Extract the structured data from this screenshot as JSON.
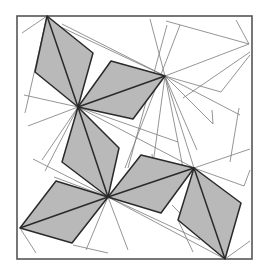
{
  "figure": {
    "kind": "geometric-diagram",
    "colors": {
      "background": "#ffffff",
      "frame": "#555555",
      "kite_fill": "#b9b9b9",
      "kite_stroke": "#2a2a2a",
      "construction_line": "#7a7a7a"
    },
    "frame": {
      "x": 17,
      "y": 16,
      "width": 235,
      "height": 243
    },
    "hub_vertices": [
      {
        "name": "A",
        "x": 47,
        "y": 16
      },
      {
        "name": "B",
        "x": 78,
        "y": 107
      },
      {
        "name": "C",
        "x": 165,
        "y": 76
      },
      {
        "name": "D",
        "x": 108,
        "y": 197
      },
      {
        "name": "E",
        "x": 20,
        "y": 228
      },
      {
        "name": "F",
        "x": 194,
        "y": 168
      },
      {
        "name": "G",
        "x": 225,
        "y": 259
      }
    ],
    "kites": [
      {
        "id": 1,
        "points": [
          [
            47,
            16
          ],
          [
            93,
            53
          ],
          [
            78,
            107
          ],
          [
            35,
            72
          ]
        ],
        "diagonal": [
          [
            47,
            16
          ],
          [
            78,
            107
          ]
        ]
      },
      {
        "id": 2,
        "points": [
          [
            78,
            107
          ],
          [
            111,
            61
          ],
          [
            165,
            76
          ],
          [
            133,
            119
          ]
        ],
        "diagonal": [
          [
            78,
            107
          ],
          [
            165,
            76
          ]
        ]
      },
      {
        "id": 3,
        "points": [
          [
            78,
            107
          ],
          [
            119,
            148
          ],
          [
            108,
            197
          ],
          [
            62,
            162
          ]
        ],
        "diagonal": [
          [
            78,
            107
          ],
          [
            108,
            197
          ]
        ]
      },
      {
        "id": 4,
        "points": [
          [
            20,
            228
          ],
          [
            56,
            181
          ],
          [
            108,
            197
          ],
          [
            72,
            243
          ]
        ],
        "diagonal": [
          [
            20,
            228
          ],
          [
            108,
            197
          ]
        ]
      },
      {
        "id": 5,
        "points": [
          [
            108,
            197
          ],
          [
            141,
            155
          ],
          [
            194,
            168
          ],
          [
            161,
            213
          ]
        ],
        "diagonal": [
          [
            108,
            197
          ],
          [
            194,
            168
          ]
        ]
      },
      {
        "id": 6,
        "points": [
          [
            194,
            168
          ],
          [
            241,
            203
          ],
          [
            225,
            259
          ],
          [
            178,
            220
          ]
        ],
        "diagonal": [
          [
            194,
            168
          ],
          [
            225,
            259
          ]
        ]
      }
    ],
    "construction_lines": [
      [
        [
          47,
          16
        ],
        [
          22,
          33
        ]
      ],
      [
        [
          47,
          16
        ],
        [
          25,
          113
        ]
      ],
      [
        [
          62,
          24
        ],
        [
          165,
          76
        ]
      ],
      [
        [
          48,
          21
        ],
        [
          165,
          76
        ]
      ],
      [
        [
          150,
          19
        ],
        [
          165,
          76
        ]
      ],
      [
        [
          167,
          25
        ],
        [
          128,
          168
        ]
      ],
      [
        [
          180,
          25
        ],
        [
          125,
          168
        ]
      ],
      [
        [
          166,
          21
        ],
        [
          249,
          44
        ]
      ],
      [
        [
          249,
          44
        ],
        [
          165,
          76
        ]
      ],
      [
        [
          250,
          52
        ],
        [
          183,
          98
        ]
      ],
      [
        [
          236,
          20
        ],
        [
          249,
          44
        ]
      ],
      [
        [
          165,
          76
        ],
        [
          221,
          92
        ]
      ],
      [
        [
          221,
          92
        ],
        [
          250,
          55
        ]
      ],
      [
        [
          165,
          76
        ],
        [
          240,
          115
        ]
      ],
      [
        [
          165,
          76
        ],
        [
          213,
          124
        ]
      ],
      [
        [
          213,
          124
        ],
        [
          212,
          110
        ]
      ],
      [
        [
          165,
          76
        ],
        [
          194,
          168
        ]
      ],
      [
        [
          165,
          76
        ],
        [
          183,
          168
        ]
      ],
      [
        [
          165,
          76
        ],
        [
          153,
          164
        ]
      ],
      [
        [
          153,
          164
        ],
        [
          152,
          154
        ]
      ],
      [
        [
          239,
          108
        ],
        [
          230,
          162
        ]
      ],
      [
        [
          194,
          168
        ],
        [
          250,
          149
        ]
      ],
      [
        [
          194,
          168
        ],
        [
          244,
          186
        ]
      ],
      [
        [
          244,
          186
        ],
        [
          250,
          170
        ]
      ],
      [
        [
          197,
          150
        ],
        [
          165,
          76
        ]
      ],
      [
        [
          24,
          95
        ],
        [
          78,
          107
        ]
      ],
      [
        [
          78,
          107
        ],
        [
          28,
          126
        ]
      ],
      [
        [
          78,
          107
        ],
        [
          42,
          160
        ]
      ],
      [
        [
          78,
          107
        ],
        [
          45,
          171
        ]
      ],
      [
        [
          78,
          107
        ],
        [
          140,
          93
        ]
      ],
      [
        [
          78,
          107
        ],
        [
          108,
          197
        ]
      ],
      [
        [
          78,
          107
        ],
        [
          194,
          168
        ]
      ],
      [
        [
          78,
          107
        ],
        [
          178,
          142
        ]
      ],
      [
        [
          78,
          107
        ],
        [
          100,
          140
        ]
      ],
      [
        [
          33,
          159
        ],
        [
          108,
          197
        ]
      ],
      [
        [
          108,
          197
        ],
        [
          20,
          228
        ]
      ],
      [
        [
          108,
          197
        ],
        [
          54,
          177
        ]
      ],
      [
        [
          108,
          197
        ],
        [
          86,
          250
        ]
      ],
      [
        [
          108,
          197
        ],
        [
          128,
          250
        ]
      ],
      [
        [
          108,
          197
        ],
        [
          225,
          259
        ]
      ],
      [
        [
          108,
          197
        ],
        [
          200,
          240
        ]
      ],
      [
        [
          108,
          197
        ],
        [
          104,
          184
        ]
      ],
      [
        [
          20,
          228
        ],
        [
          36,
          253
        ]
      ],
      [
        [
          73,
          245
        ],
        [
          108,
          253
        ]
      ],
      [
        [
          225,
          259
        ],
        [
          250,
          241
        ]
      ],
      [
        [
          225,
          259
        ],
        [
          172,
          205
        ]
      ],
      [
        [
          178,
          220
        ],
        [
          193,
          252
        ]
      ]
    ]
  }
}
